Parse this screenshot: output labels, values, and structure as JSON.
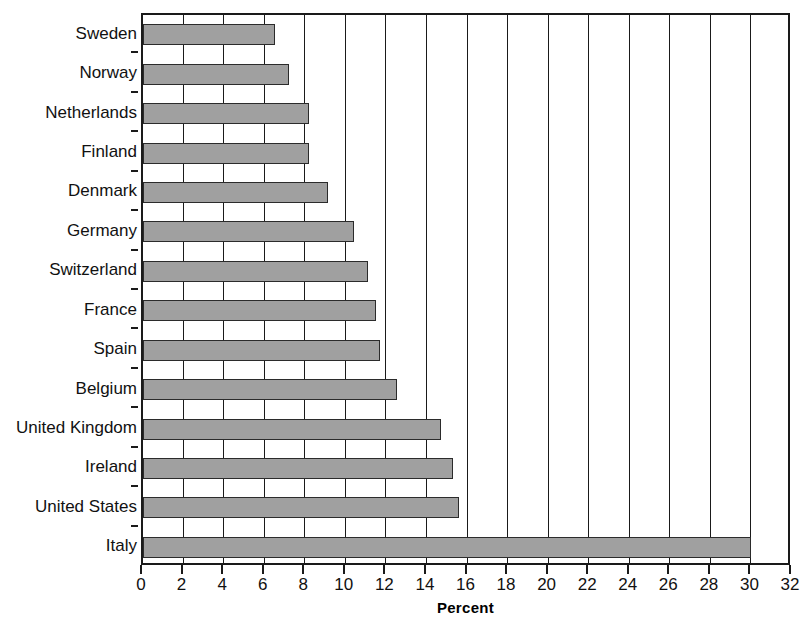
{
  "chart_data": {
    "type": "bar",
    "orientation": "horizontal",
    "title": "",
    "xlabel": "Percent",
    "ylabel": "",
    "xlim": [
      0,
      32
    ],
    "xticks": [
      0,
      2,
      4,
      6,
      8,
      10,
      12,
      14,
      16,
      18,
      20,
      22,
      24,
      26,
      28,
      30,
      32
    ],
    "xtick_labels": [
      "0",
      "2",
      "4",
      "6",
      "8",
      "10",
      "12",
      "14",
      "16",
      "18",
      "20",
      "22",
      "24",
      "26",
      "28",
      "30",
      "32"
    ],
    "grid": "vertical",
    "legend": null,
    "categories": [
      "Sweden",
      "Norway",
      "Netherlands",
      "Finland",
      "Denmark",
      "Germany",
      "Switzerland",
      "France",
      "Spain",
      "Belgium",
      "United Kingdom",
      "Ireland",
      "United States",
      "Italy"
    ],
    "values": [
      6.5,
      7.2,
      8.2,
      8.2,
      9.1,
      10.4,
      11.1,
      11.5,
      11.7,
      12.5,
      14.7,
      15.3,
      15.6,
      30.0
    ],
    "bar_color": "#a0a0a0",
    "bar_edge_color": "#2b2b2b",
    "axis_color": "#1a1a1a",
    "background_color": "#ffffff"
  }
}
